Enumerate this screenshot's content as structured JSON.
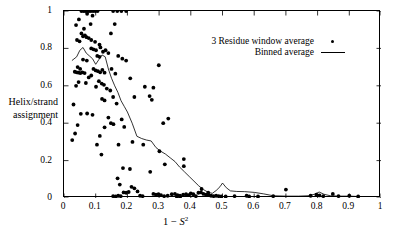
{
  "chart_data": {
    "type": "scatter",
    "title": "",
    "xlabel": "1 - S2",
    "xlabel_parts": {
      "prefix": "1 − ",
      "italic": "S",
      "superscript": "2"
    },
    "ylabel": "Helix/strand assignment",
    "ylabel_line1": "Helix/strand",
    "ylabel_line2": "assignment",
    "xlim": [
      0,
      1
    ],
    "ylim": [
      0,
      1
    ],
    "xticks": [
      0,
      0.1,
      0.2,
      0.3,
      0.4,
      0.5,
      0.6,
      0.7,
      0.8,
      0.9,
      1
    ],
    "yticks": [
      0,
      0.2,
      0.4,
      0.6,
      0.8,
      1
    ],
    "xtick_labels": [
      "0",
      "0.1",
      "0.2",
      "0.3",
      "0.4",
      "0.5",
      "0.6",
      "0.7",
      "0.8",
      "0.9",
      "1"
    ],
    "ytick_labels": [
      "0",
      "0.2",
      "0.4",
      "0.6",
      "0.8",
      "1"
    ],
    "grid": false,
    "frame": "box",
    "tick_direction": "in",
    "legend_position": "top-right-inside",
    "marker_color": "#000000",
    "line_color": "#000000",
    "series": [
      {
        "name": "3 Residue window average",
        "type": "scatter",
        "marker": "filled-circle",
        "points": [
          [
            0.055,
            1.0
          ],
          [
            0.062,
            1.0
          ],
          [
            0.068,
            1.0
          ],
          [
            0.074,
            1.0
          ],
          [
            0.079,
            1.0
          ],
          [
            0.085,
            1.0
          ],
          [
            0.092,
            1.0
          ],
          [
            0.099,
            1.0
          ],
          [
            0.106,
            1.0
          ],
          [
            0.155,
            1.0
          ],
          [
            0.168,
            1.0
          ],
          [
            0.181,
            1.0
          ],
          [
            0.196,
            1.0
          ],
          [
            0.047,
            0.955
          ],
          [
            0.073,
            0.985
          ],
          [
            0.09,
            0.975
          ],
          [
            0.038,
            0.925
          ],
          [
            0.063,
            0.905
          ],
          [
            0.084,
            0.93
          ],
          [
            0.055,
            0.88
          ],
          [
            0.06,
            0.865
          ],
          [
            0.066,
            0.87
          ],
          [
            0.071,
            0.86
          ],
          [
            0.078,
            0.855
          ],
          [
            0.086,
            0.845
          ],
          [
            0.041,
            0.845
          ],
          [
            0.049,
            0.838
          ],
          [
            0.16,
            0.93
          ],
          [
            0.148,
            0.88
          ],
          [
            0.098,
            0.835
          ],
          [
            0.112,
            0.82
          ],
          [
            0.086,
            0.8
          ],
          [
            0.093,
            0.795
          ],
          [
            0.101,
            0.79
          ],
          [
            0.115,
            0.805
          ],
          [
            0.123,
            0.782
          ],
          [
            0.131,
            0.79
          ],
          [
            0.14,
            0.775
          ],
          [
            0.105,
            0.76
          ],
          [
            0.112,
            0.755
          ],
          [
            0.171,
            0.76
          ],
          [
            0.184,
            0.745
          ],
          [
            0.06,
            0.74
          ],
          [
            0.072,
            0.735
          ],
          [
            0.043,
            0.7
          ],
          [
            0.051,
            0.69
          ],
          [
            0.034,
            0.675
          ],
          [
            0.04,
            0.672
          ],
          [
            0.046,
            0.67
          ],
          [
            0.052,
            0.668
          ],
          [
            0.058,
            0.672
          ],
          [
            0.065,
            0.668
          ],
          [
            0.093,
            0.69
          ],
          [
            0.1,
            0.682
          ],
          [
            0.107,
            0.678
          ],
          [
            0.114,
            0.672
          ],
          [
            0.121,
            0.685
          ],
          [
            0.128,
            0.67
          ],
          [
            0.078,
            0.645
          ],
          [
            0.086,
            0.655
          ],
          [
            0.15,
            0.69
          ],
          [
            0.162,
            0.665
          ],
          [
            0.196,
            0.735
          ],
          [
            0.209,
            0.64
          ],
          [
            0.046,
            0.62
          ],
          [
            0.069,
            0.615
          ],
          [
            0.11,
            0.625
          ],
          [
            0.119,
            0.612
          ],
          [
            0.126,
            0.605
          ],
          [
            0.038,
            0.6
          ],
          [
            0.101,
            0.595
          ],
          [
            0.255,
            0.595
          ],
          [
            0.282,
            0.59
          ],
          [
            0.135,
            0.585
          ],
          [
            0.146,
            0.575
          ],
          [
            0.27,
            0.545
          ],
          [
            0.299,
            0.71
          ],
          [
            0.03,
            0.5
          ],
          [
            0.12,
            0.53
          ],
          [
            0.128,
            0.522
          ],
          [
            0.155,
            0.54
          ],
          [
            0.166,
            0.505
          ],
          [
            0.222,
            0.54
          ],
          [
            0.277,
            0.525
          ],
          [
            0.053,
            0.45
          ],
          [
            0.073,
            0.452
          ],
          [
            0.09,
            0.445
          ],
          [
            0.14,
            0.43
          ],
          [
            0.148,
            0.4
          ],
          [
            0.156,
            0.395
          ],
          [
            0.182,
            0.42
          ],
          [
            0.19,
            0.38
          ],
          [
            0.313,
            0.4
          ],
          [
            0.329,
            0.425
          ],
          [
            0.043,
            0.39
          ],
          [
            0.128,
            0.378
          ],
          [
            0.035,
            0.345
          ],
          [
            0.113,
            0.332
          ],
          [
            0.026,
            0.31
          ],
          [
            0.216,
            0.3
          ],
          [
            0.25,
            0.285
          ],
          [
            0.301,
            0.25
          ],
          [
            0.104,
            0.285
          ],
          [
            0.172,
            0.285
          ],
          [
            0.118,
            0.232
          ],
          [
            0.378,
            0.208
          ],
          [
            0.318,
            0.18
          ],
          [
            0.378,
            0.17
          ],
          [
            0.186,
            0.16
          ],
          [
            0.208,
            0.155
          ],
          [
            0.272,
            0.14
          ],
          [
            0.169,
            0.105
          ],
          [
            0.176,
            0.072
          ],
          [
            0.213,
            0.06
          ],
          [
            0.222,
            0.052
          ],
          [
            0.188,
            0.03
          ],
          [
            0.196,
            0.028
          ],
          [
            0.204,
            0.032
          ],
          [
            0.232,
            0.035
          ],
          [
            0.155,
            0.01
          ],
          [
            0.163,
            0.008
          ],
          [
            0.171,
            0.012
          ],
          [
            0.179,
            0.01
          ],
          [
            0.24,
            0.012
          ],
          [
            0.248,
            0.01
          ],
          [
            0.282,
            0.022
          ],
          [
            0.29,
            0.018
          ],
          [
            0.298,
            0.02
          ],
          [
            0.306,
            0.015
          ],
          [
            0.316,
            0.01
          ],
          [
            0.327,
            0.012
          ],
          [
            0.34,
            0.02
          ],
          [
            0.35,
            0.022
          ],
          [
            0.358,
            0.015
          ],
          [
            0.366,
            0.012
          ],
          [
            0.376,
            0.018
          ],
          [
            0.385,
            0.02
          ],
          [
            0.393,
            0.015
          ],
          [
            0.4,
            0.025
          ],
          [
            0.408,
            0.02
          ],
          [
            0.416,
            0.01
          ],
          [
            0.424,
            0.028
          ],
          [
            0.432,
            0.03
          ],
          [
            0.44,
            0.022
          ],
          [
            0.448,
            0.018
          ],
          [
            0.456,
            0.015
          ],
          [
            0.464,
            0.012
          ],
          [
            0.472,
            0.01
          ],
          [
            0.48,
            0.012
          ],
          [
            0.488,
            0.01
          ],
          [
            0.496,
            0.008
          ],
          [
            0.356,
            0.008
          ],
          [
            0.366,
            0.006
          ],
          [
            0.51,
            0.008
          ],
          [
            0.538,
            0.01
          ],
          [
            0.576,
            0.012
          ],
          [
            0.584,
            0.008
          ],
          [
            0.612,
            0.008
          ],
          [
            0.66,
            0.01
          ],
          [
            0.7,
            0.045
          ],
          [
            0.778,
            0.012
          ],
          [
            0.796,
            0.018
          ],
          [
            0.806,
            0.014
          ],
          [
            0.818,
            0.01
          ],
          [
            0.848,
            0.022
          ],
          [
            0.866,
            0.01
          ],
          [
            0.9,
            0.012
          ],
          [
            0.928,
            0.008
          ],
          [
            0.455,
            0.028
          ],
          [
            0.434,
            0.048
          ]
        ]
      },
      {
        "name": "Binned average",
        "type": "line",
        "points": [
          [
            0.025,
            0.735
          ],
          [
            0.04,
            0.755
          ],
          [
            0.05,
            0.79
          ],
          [
            0.06,
            0.805
          ],
          [
            0.07,
            0.775
          ],
          [
            0.08,
            0.76
          ],
          [
            0.09,
            0.745
          ],
          [
            0.1,
            0.715
          ],
          [
            0.11,
            0.74
          ],
          [
            0.12,
            0.765
          ],
          [
            0.13,
            0.755
          ],
          [
            0.14,
            0.69
          ],
          [
            0.15,
            0.64
          ],
          [
            0.16,
            0.6
          ],
          [
            0.17,
            0.565
          ],
          [
            0.18,
            0.52
          ],
          [
            0.19,
            0.49
          ],
          [
            0.2,
            0.46
          ],
          [
            0.215,
            0.4
          ],
          [
            0.23,
            0.33
          ],
          [
            0.245,
            0.318
          ],
          [
            0.26,
            0.31
          ],
          [
            0.275,
            0.305
          ],
          [
            0.29,
            0.27
          ],
          [
            0.305,
            0.25
          ],
          [
            0.32,
            0.235
          ],
          [
            0.335,
            0.215
          ],
          [
            0.35,
            0.195
          ],
          [
            0.365,
            0.165
          ],
          [
            0.38,
            0.14
          ],
          [
            0.395,
            0.115
          ],
          [
            0.41,
            0.09
          ],
          [
            0.425,
            0.065
          ],
          [
            0.44,
            0.045
          ],
          [
            0.455,
            0.03
          ],
          [
            0.468,
            0.025
          ],
          [
            0.48,
            0.04
          ],
          [
            0.492,
            0.06
          ],
          [
            0.5,
            0.08
          ],
          [
            0.512,
            0.055
          ],
          [
            0.525,
            0.038
          ],
          [
            0.545,
            0.035
          ],
          [
            0.57,
            0.034
          ],
          [
            0.6,
            0.03
          ],
          [
            0.63,
            0.022
          ],
          [
            0.66,
            0.012
          ],
          [
            0.7,
            0.01
          ],
          [
            0.74,
            0.01
          ],
          [
            0.77,
            0.012
          ],
          [
            0.79,
            0.02
          ],
          [
            0.805,
            0.032
          ],
          [
            0.82,
            0.02
          ],
          [
            0.84,
            0.012
          ],
          [
            0.87,
            0.01
          ],
          [
            0.9,
            0.01
          ],
          [
            0.93,
            0.008
          ],
          [
            0.955,
            0.008
          ]
        ]
      }
    ]
  },
  "legend": {
    "entries": [
      {
        "label": "3 Residue window average",
        "key": "dot"
      },
      {
        "label": "Binned average",
        "key": "line"
      }
    ]
  }
}
